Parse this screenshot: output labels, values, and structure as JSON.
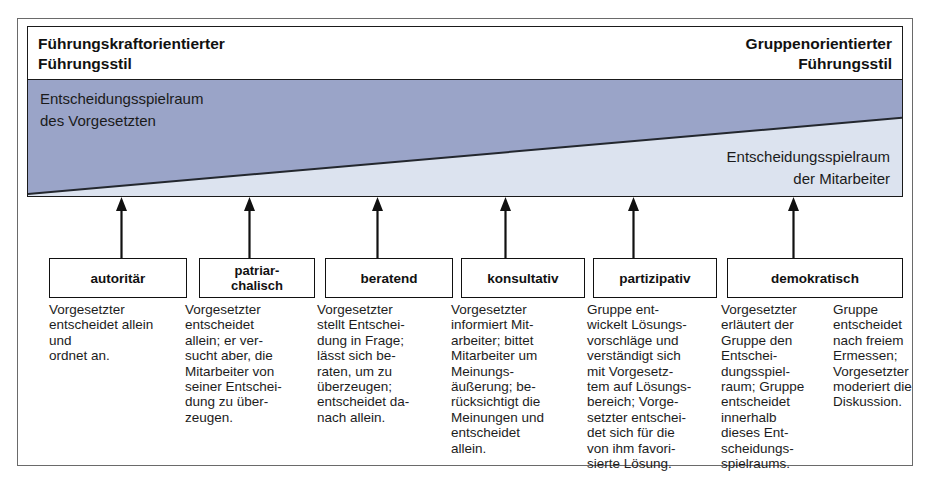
{
  "diagram": {
    "title_left": "Führungskraftorientierter\nFührungsstil",
    "title_right": "Gruppenorientierter\nFührungsstil",
    "band": {
      "label_manager": "Entscheidungsspielraum\ndes Vorgesetzten",
      "label_staff": "Entscheidungsspielraum\nder Mitarbeiter",
      "color_manager": "#9aa4c8",
      "color_staff": "#dce3ef",
      "divider_color": "#23272e"
    },
    "styles": [
      {
        "label": "autoritär"
      },
      {
        "label": "patriar-\nchalisch"
      },
      {
        "label": "beratend"
      },
      {
        "label": "konsultativ"
      },
      {
        "label": "partizipativ"
      },
      {
        "label": "demokratisch"
      }
    ],
    "descriptions": [
      "Vorgesetzter\nentscheidet allein\nund\nordnet an.",
      "Vorgesetzter\nentscheidet\nallein; er ver-\nsucht aber, die\nMitarbeiter von\nseiner Entschei-\ndung zu über-\nzeugen.",
      "Vorgesetzter\nstellt Entschei-\ndung in Frage;\nlässt sich be-\nraten, um zu\nüberzeugen;\nentscheidet da-\nnach allein.",
      "Vorgesetzter\ninformiert Mit-\narbeiter; bittet\nMitarbeiter um\nMeinungs-\näußerung; be-\nrücksichtigt die\nMeinungen und\nentscheidet\nallein.",
      "Gruppe ent-\nwickelt Lösungs-\nvorschläge und\nverständigt sich\nmit Vorgesetz-\ntem auf Lösungs-\nbereich; Vorge-\nsetzter entschei-\ndet sich für die\nvon ihm favori-\nsierte Lösung.",
      "Vorgesetzter\nerläutert der\nGruppe den\nEntschei-\ndungsspiel-\nraum; Gruppe\nentscheidet\ninnerhalb\ndieses Ent-\nscheidungs-\nspielraums.",
      "Gruppe\nentscheidet\nnach freiem\nErmessen;\nVorgesetzter\nmoderiert die\nDiskussion."
    ]
  }
}
